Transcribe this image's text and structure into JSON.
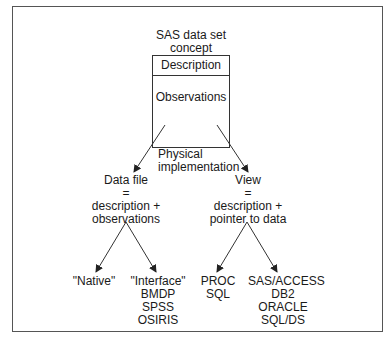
{
  "diagram": {
    "root": {
      "title": "SAS data set\nconcept",
      "sections": [
        "Description",
        "Observations"
      ]
    },
    "edge_label": "Physical\nimplementation",
    "branches": [
      {
        "label": "Data file\n=\ndescription +\nobservations",
        "children": [
          "\"Native\"",
          "\"Interface\"\nBMDP\nSPSS\nOSIRIS"
        ]
      },
      {
        "label": "View\n=\ndescription +\npointer to data",
        "children": [
          "PROC SQL",
          "SAS/ACCESS\nDB2\nORACLE\nSQL/DS"
        ]
      }
    ]
  }
}
